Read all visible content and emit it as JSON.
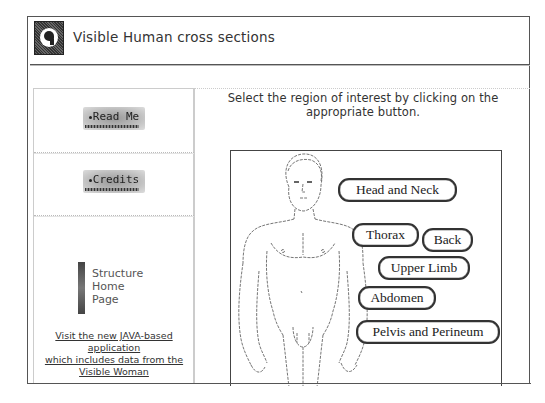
{
  "header": {
    "title": "Visible Human cross sections",
    "logo_icon": "visible-human-head-logo"
  },
  "sidebar": {
    "read_me": "Read Me",
    "credits": "Credits",
    "structure_home": [
      "Structure",
      "Home",
      "Page"
    ],
    "java_link": {
      "line1": "Visit the new JAVA-based",
      "line2": "application",
      "line3": "which includes data from the",
      "line4": "Visible Woman"
    }
  },
  "main": {
    "instruction_line1": "Select the region of interest by clicking on the",
    "instruction_line2": "appropriate button.",
    "regions": [
      {
        "id": "head-and-neck",
        "label": "Head and Neck"
      },
      {
        "id": "thorax",
        "label": "Thorax"
      },
      {
        "id": "back",
        "label": "Back"
      },
      {
        "id": "upper-limb",
        "label": "Upper Limb"
      },
      {
        "id": "abdomen",
        "label": "Abdomen"
      },
      {
        "id": "pelvis-and-perineum",
        "label": "Pelvis and Perineum"
      }
    ]
  }
}
